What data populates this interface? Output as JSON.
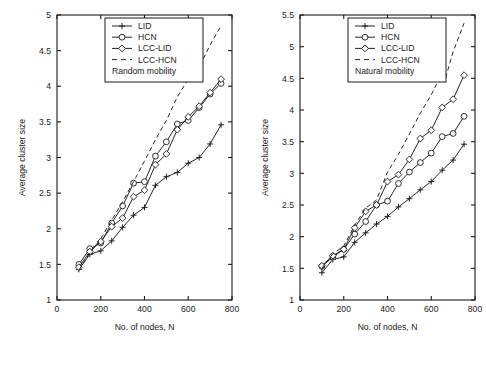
{
  "figure": {
    "panel_count": 2,
    "background": "#ffffff",
    "ink_color": "#1a1a1a"
  },
  "chart_data": [
    {
      "type": "line",
      "title": "",
      "subtitle": "Random mobility",
      "xlabel": "No. of nodes, N",
      "ylabel": "Average cluster size",
      "xlim": [
        0,
        800
      ],
      "ylim": [
        1,
        5
      ],
      "xticks": [
        0,
        200,
        400,
        600,
        800
      ],
      "xticklabels": [
        "0",
        "200",
        "400",
        "600",
        "800"
      ],
      "yticks": [
        1,
        1.5,
        2,
        2.5,
        3,
        3.5,
        4,
        4.5,
        5
      ],
      "yticklabels": [
        "1",
        "1.5",
        "2",
        "2.5",
        "3",
        "3.5",
        "4",
        "4.5",
        "5"
      ],
      "grid": false,
      "legend_position": "top-center",
      "legend_entries": [
        "LID",
        "HCN",
        "LCC-LID",
        "LCC-HCN",
        "Random mobility"
      ],
      "series": [
        {
          "name": "LID",
          "marker": "plus",
          "linestyle": "solid",
          "x": [
            100,
            150,
            200,
            250,
            300,
            350,
            400,
            450,
            500,
            550,
            600,
            650,
            700,
            750
          ],
          "values": [
            1.43,
            1.64,
            1.69,
            1.83,
            2.02,
            2.19,
            2.3,
            2.61,
            2.73,
            2.79,
            2.92,
            3.0,
            3.19,
            3.46
          ]
        },
        {
          "name": "HCN",
          "marker": "circle",
          "linestyle": "solid",
          "x": [
            100,
            150,
            200,
            250,
            300,
            350,
            400,
            450,
            500,
            550,
            600,
            650,
            700,
            750
          ],
          "values": [
            1.5,
            1.72,
            1.8,
            2.08,
            2.32,
            2.64,
            2.66,
            3.02,
            3.22,
            3.47,
            3.52,
            3.7,
            3.89,
            4.04
          ]
        },
        {
          "name": "LCC-LID",
          "marker": "diamond",
          "linestyle": "solid",
          "x": [
            100,
            150,
            200,
            250,
            300,
            350,
            400,
            450,
            500,
            550,
            600,
            650,
            700,
            750
          ],
          "values": [
            1.46,
            1.68,
            1.82,
            2.03,
            2.15,
            2.45,
            2.54,
            2.9,
            3.05,
            3.39,
            3.57,
            3.72,
            3.91,
            4.1
          ]
        },
        {
          "name": "LCC-HCN",
          "marker": "none",
          "linestyle": "dashed",
          "x": [
            100,
            150,
            200,
            250,
            300,
            350,
            400,
            450,
            500,
            550,
            600,
            625,
            650,
            700,
            750
          ],
          "values": [
            1.42,
            1.66,
            1.86,
            2.12,
            2.38,
            2.66,
            2.95,
            3.25,
            3.52,
            3.85,
            4.1,
            4.23,
            4.27,
            4.58,
            4.85
          ]
        }
      ]
    },
    {
      "type": "line",
      "title": "",
      "subtitle": "Natural mobility",
      "xlabel": "No. of nodes, N",
      "ylabel": "Average cluster size",
      "xlim": [
        0,
        800
      ],
      "ylim": [
        1,
        5.5
      ],
      "xticks": [
        0,
        200,
        400,
        600,
        800
      ],
      "xticklabels": [
        "0",
        "200",
        "400",
        "600",
        "800"
      ],
      "yticks": [
        1,
        1.5,
        2,
        2.5,
        3,
        3.5,
        4,
        4.5,
        5,
        5.5
      ],
      "yticklabels": [
        "1",
        "1.5",
        "2",
        "2.5",
        "3",
        "3.5",
        "4",
        "4.5",
        "5",
        "5.5"
      ],
      "grid": false,
      "legend_position": "top-center",
      "legend_entries": [
        "LID",
        "HCN",
        "LCC-LID",
        "LCC-HCN",
        "Natural mobility"
      ],
      "series": [
        {
          "name": "LID",
          "marker": "plus",
          "linestyle": "solid",
          "x": [
            100,
            150,
            200,
            250,
            300,
            350,
            400,
            450,
            500,
            550,
            600,
            650,
            700,
            750
          ],
          "values": [
            1.43,
            1.64,
            1.68,
            1.91,
            2.06,
            2.2,
            2.32,
            2.47,
            2.6,
            2.74,
            2.87,
            3.05,
            3.21,
            3.46
          ]
        },
        {
          "name": "HCN",
          "marker": "circle",
          "linestyle": "solid",
          "x": [
            100,
            150,
            200,
            250,
            300,
            350,
            400,
            450,
            500,
            550,
            600,
            650,
            700,
            750
          ],
          "values": [
            1.53,
            1.68,
            1.8,
            2.04,
            2.24,
            2.5,
            2.56,
            2.84,
            3.02,
            3.17,
            3.32,
            3.58,
            3.63,
            3.9
          ]
        },
        {
          "name": "LCC-LID",
          "marker": "diamond",
          "linestyle": "solid",
          "x": [
            100,
            150,
            200,
            250,
            300,
            350,
            400,
            450,
            500,
            550,
            600,
            650,
            700,
            750
          ],
          "values": [
            1.54,
            1.7,
            1.8,
            2.14,
            2.4,
            2.5,
            2.87,
            2.98,
            3.22,
            3.55,
            3.68,
            4.04,
            4.17,
            4.55
          ]
        },
        {
          "name": "LCC-HCN",
          "marker": "none",
          "linestyle": "dashed",
          "x": [
            100,
            150,
            200,
            250,
            300,
            350,
            400,
            450,
            500,
            550,
            600,
            640,
            660,
            700,
            750
          ],
          "values": [
            1.5,
            1.73,
            1.85,
            2.18,
            2.45,
            2.58,
            3.02,
            3.3,
            3.62,
            3.95,
            4.24,
            4.52,
            4.44,
            4.92,
            5.37
          ]
        }
      ]
    }
  ]
}
